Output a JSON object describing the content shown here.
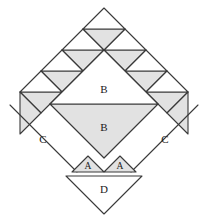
{
  "figure": {
    "name": "dissection-puzzle-diagram",
    "canvas": {
      "width": 208,
      "height": 218
    },
    "style": {
      "stroke": "#3a3a3a",
      "stroke_light": "#555555",
      "fill_white": "#ffffff",
      "fill_gray": "#e2e2e2",
      "fill_gray_dark": "#d9d9d9",
      "background": "#ffffff",
      "label_color": "#1a1a1a",
      "stroke_width": 1.1
    },
    "labels": {
      "center_upper": "B",
      "center_lower": "B",
      "left_parallelogram": "C",
      "right_parallelogram": "C",
      "bottom_left_triangle": "A",
      "bottom_right_triangle": "A",
      "bottom_triangle": "D"
    },
    "geometry": {
      "center_diamond": {
        "top": [
          104,
          50
        ],
        "right": [
          158,
          104
        ],
        "bottom": [
          104,
          158
        ],
        "left": [
          50,
          104
        ],
        "split_line_y": 104
      },
      "apex_unit": {
        "top": [
          104,
          8
        ],
        "right": [
          125,
          29
        ],
        "bottom": [
          104,
          50
        ],
        "left": [
          83,
          29
        ],
        "split_y": 29
      },
      "left_band_units": [
        {
          "cx": 83,
          "cy": 50
        },
        {
          "cx": 62,
          "cy": 71
        },
        {
          "cx": 41,
          "cy": 92
        },
        {
          "cx": 20,
          "cy": 113
        }
      ],
      "right_band_units": [
        {
          "cx": 125,
          "cy": 50
        },
        {
          "cx": 146,
          "cy": 71
        },
        {
          "cx": 167,
          "cy": 92
        },
        {
          "cx": 188,
          "cy": 113
        }
      ],
      "left_parallelogram": [
        [
          10,
          105
        ],
        [
          48,
          143
        ],
        [
          77,
          172
        ],
        [
          39,
          134
        ]
      ],
      "right_parallelogram": [
        [
          198,
          105
        ],
        [
          160,
          143
        ],
        [
          131,
          172
        ],
        [
          169,
          134
        ]
      ],
      "bottom_left_triangle": [
        [
          72,
          172
        ],
        [
          104,
          172
        ],
        [
          88,
          156
        ]
      ],
      "bottom_right_triangle": [
        [
          136,
          172
        ],
        [
          104,
          172
        ],
        [
          120,
          156
        ]
      ],
      "bottom_triangle": [
        [
          66,
          176
        ],
        [
          142,
          176
        ],
        [
          104,
          214
        ]
      ]
    },
    "counts": {
      "left_band_unit_count": 4,
      "right_band_unit_count": 4,
      "apex_unit_count": 1,
      "parallelogram_count": 2,
      "small_triangle_count": 2
    }
  }
}
